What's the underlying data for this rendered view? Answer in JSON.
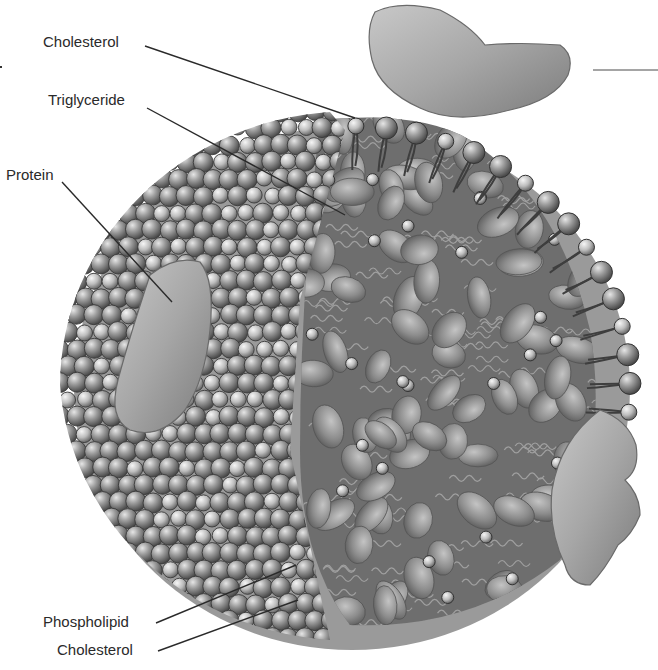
{
  "figure": {
    "colors": {
      "background": "#ffffff",
      "shell": "#9a9a9a",
      "sphere_light": "#cfcfcf",
      "sphere_mid": "#8e8e8e",
      "sphere_dark": "#4a4a4a",
      "core": "#6e6e6e",
      "protein": "#a8a8a8",
      "leader_line": "#2a2a2a"
    }
  },
  "labels": {
    "cholesterol_top": "Cholesterol",
    "triglyceride": "Triglyceride",
    "protein": "Protein",
    "phospholipid": "Phospholipid",
    "cholesterol_bottom": "Cholesterol"
  }
}
